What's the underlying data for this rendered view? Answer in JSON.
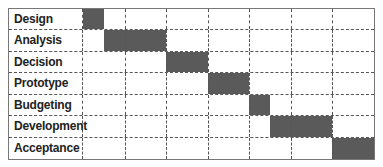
{
  "chart_data": {
    "type": "gantt",
    "title": "",
    "categories": [
      "Design",
      "Analysis",
      "Decision",
      "Prototype",
      "Budgeting",
      "Development",
      "Acceptance"
    ],
    "time_units": 7,
    "tasks": [
      {
        "name": "Design",
        "start": 0,
        "end": 0.5
      },
      {
        "name": "Analysis",
        "start": 0.5,
        "end": 2
      },
      {
        "name": "Decision",
        "start": 2,
        "end": 3
      },
      {
        "name": "Prototype",
        "start": 3,
        "end": 4
      },
      {
        "name": "Budgeting",
        "start": 4,
        "end": 4.5
      },
      {
        "name": "Development",
        "start": 4.5,
        "end": 6
      },
      {
        "name": "Acceptance",
        "start": 6,
        "end": 7
      }
    ],
    "grid": true,
    "bar_color": "#5a5a5a",
    "xlabel": "",
    "ylabel": ""
  }
}
